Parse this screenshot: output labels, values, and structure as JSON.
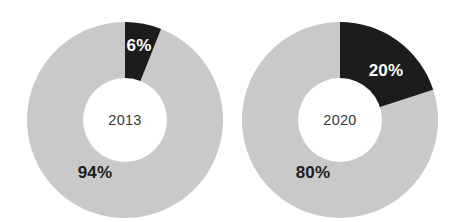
{
  "figure": {
    "background_color": "#ffffff",
    "width": 452,
    "height": 222
  },
  "palette": {
    "light_gray": "#c9c9c9",
    "dark": "#1c1c1c",
    "hole": "#ffffff",
    "year_text": "#3a3a3a",
    "label_on_dark": "#ffffff",
    "label_on_light": "#1c1c1c"
  },
  "charts": [
    {
      "id": "donut-2013",
      "center_label": "2013",
      "slices": [
        {
          "name": "share",
          "label": "6%",
          "value": 6,
          "color": "#1c1c1c",
          "label_color": "#ffffff"
        },
        {
          "name": "remainder",
          "label": "94%",
          "value": 94,
          "color": "#c9c9c9",
          "label_color": "#1c1c1c"
        }
      ]
    },
    {
      "id": "donut-2020",
      "center_label": "2020",
      "slices": [
        {
          "name": "share",
          "label": "20%",
          "value": 20,
          "color": "#1c1c1c",
          "label_color": "#ffffff"
        },
        {
          "name": "remainder",
          "label": "80%",
          "value": 80,
          "color": "#c9c9c9",
          "label_color": "#1c1c1c"
        }
      ]
    }
  ],
  "chart_data": {
    "type": "pie",
    "variant": "donut",
    "title": "",
    "subtitle": "",
    "xlabel": "",
    "ylabel": "",
    "legend": "none",
    "grid": false,
    "units": "percent",
    "start_angle_deg": 0,
    "direction": "clockwise",
    "inner_radius_ratio": 0.43,
    "panels": [
      {
        "name": "2013",
        "center_label": "2013",
        "labels": [
          "6%",
          "94%"
        ],
        "values": [
          6,
          94
        ],
        "colors": [
          "#1c1c1c",
          "#c9c9c9"
        ]
      },
      {
        "name": "2020",
        "center_label": "2020",
        "labels": [
          "20%",
          "80%"
        ],
        "values": [
          20,
          80
        ],
        "colors": [
          "#1c1c1c",
          "#c9c9c9"
        ]
      }
    ]
  }
}
